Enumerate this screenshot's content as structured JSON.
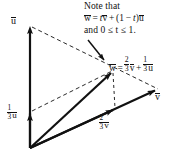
{
  "figure": {
    "background_color": "#ffffff",
    "ink_color": "#111111",
    "width": 184,
    "height": 163
  },
  "note": {
    "line1": "Note that",
    "line2_lhs": "w",
    "line2_eq": "=",
    "line2_t": "t",
    "line2_v": "v",
    "line2_plus": "+",
    "line2_open": "(1",
    "line2_minus": "−",
    "line2_t2": "t",
    "line2_close": ")",
    "line2_u": "u",
    "line3": "and 0 ≤ t ≤ 1."
  },
  "w_equation": {
    "lhs": "w",
    "eq": "=",
    "coef1_num": "2",
    "coef1_den": "3",
    "v": "v",
    "plus": "+",
    "coef2_num": "1",
    "coef2_den": "3",
    "u": "u"
  },
  "labels": {
    "u": "u",
    "v": "v",
    "third_u_num": "1",
    "third_u_den": "3",
    "third_u_vec": "u",
    "twothird_v_num": "2",
    "twothird_v_den": "3",
    "twothird_v_vec": "v"
  },
  "geometry": {
    "origin": [
      30,
      148
    ],
    "u_tip": [
      30,
      25
    ],
    "third_u_tip": [
      30,
      112
    ],
    "v_tip": [
      158,
      88
    ],
    "w_tip": [
      113,
      70
    ],
    "twothird_v_tip": [
      115,
      108
    ]
  }
}
